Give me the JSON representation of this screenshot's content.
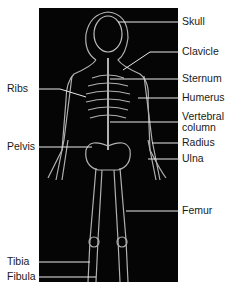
{
  "figure": {
    "background": "#050505",
    "line_color": "#e8e8e8",
    "labels_right": [
      {
        "text": "Skull",
        "y": 16
      },
      {
        "text": "Clavicle",
        "y": 46
      },
      {
        "text": "Sternum",
        "y": 73
      },
      {
        "text": "Humerus",
        "y": 92
      },
      {
        "text": "Vertebral",
        "y": 111
      },
      {
        "text": "column",
        "y": 122
      },
      {
        "text": "Radius",
        "y": 137
      },
      {
        "text": "Ulna",
        "y": 153
      },
      {
        "text": "Femur",
        "y": 205
      }
    ],
    "labels_left": [
      {
        "text": "Ribs",
        "y": 83
      },
      {
        "text": "Pelvis",
        "y": 141
      },
      {
        "text": "Tibia",
        "y": 256
      },
      {
        "text": "Fibula",
        "y": 271
      }
    ]
  }
}
